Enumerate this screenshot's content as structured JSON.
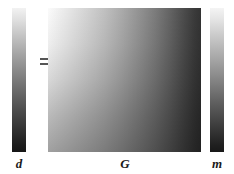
{
  "figure": {
    "equation": "d = G m"
  },
  "data_vector": {
    "label": "d",
    "gradient_from": "#f2f2f2",
    "gradient_to": "#161616",
    "orientation": "vertical"
  },
  "operator": {
    "label": "=",
    "name": "equals-sign"
  },
  "matrix": {
    "label": "G",
    "gradient_from": "#fbfbfb",
    "gradient_to": "#333333",
    "orientation": "diagonal-top-left-to-bottom-right"
  },
  "model_vector": {
    "label": "m",
    "gradient_from": "#f4f4f4",
    "gradient_to": "#181818",
    "orientation": "vertical"
  },
  "colors": {
    "background": "#ffffff",
    "label_text": "#1a1a1a",
    "equals_stroke": "#555555"
  }
}
